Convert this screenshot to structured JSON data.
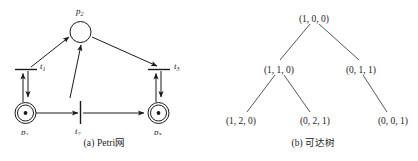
{
  "figure": {
    "background_color": "#ffffff",
    "ink_color": "#1a1a1a",
    "tree_edge_color": "#3d4450"
  },
  "petri_net": {
    "caption": "(a) Petri网",
    "places": [
      {
        "id": "p1",
        "label": "p",
        "subscript": "1",
        "tokens": 1,
        "token_marks": "•"
      },
      {
        "id": "p2",
        "label": "p",
        "subscript": "2",
        "tokens": 0,
        "token_marks": ""
      },
      {
        "id": "p3",
        "label": "p",
        "subscript": "3",
        "tokens": 1,
        "token_marks": "•"
      }
    ],
    "transitions": [
      {
        "id": "t1",
        "label": "t",
        "subscript": "1"
      },
      {
        "id": "t2",
        "label": "t",
        "subscript": "2"
      },
      {
        "id": "t3",
        "label": "t",
        "subscript": "3"
      }
    ],
    "arcs": [
      {
        "from": "p1",
        "to": "t1"
      },
      {
        "from": "t1",
        "to": "p1"
      },
      {
        "from": "t1",
        "to": "p2"
      },
      {
        "from": "p1",
        "to": "t2"
      },
      {
        "from": "t2",
        "to": "p2"
      },
      {
        "from": "t2",
        "to": "p3"
      },
      {
        "from": "p2",
        "to": "t3"
      },
      {
        "from": "p3",
        "to": "t3"
      },
      {
        "from": "t3",
        "to": "p3"
      }
    ]
  },
  "reachability_tree": {
    "caption": "(b) 可达树",
    "levels": [
      {
        "nodes": [
          "(1, 0, 0)"
        ]
      },
      {
        "nodes": [
          "(1, 1, 0)",
          "(0, 1, 1)"
        ]
      },
      {
        "nodes": [
          "(1, 2, 0)",
          "(0, 2, 1)",
          "(0, 0, 1)"
        ]
      }
    ],
    "root": "(1, 0, 0)",
    "node_l2_left": "(1, 1, 0)",
    "node_l2_right": "(0, 1, 1)",
    "node_l3_a": "(1, 2, 0)",
    "node_l3_b": "(0, 2, 1)",
    "node_l3_c": "(0, 0, 1)",
    "edges": [
      {
        "from": "(1, 0, 0)",
        "to": "(1, 1, 0)"
      },
      {
        "from": "(1, 0, 0)",
        "to": "(0, 1, 1)"
      },
      {
        "from": "(1, 1, 0)",
        "to": "(1, 2, 0)"
      },
      {
        "from": "(1, 1, 0)",
        "to": "(0, 2, 1)"
      },
      {
        "from": "(0, 1, 1)",
        "to": "(0, 0, 1)"
      }
    ]
  }
}
